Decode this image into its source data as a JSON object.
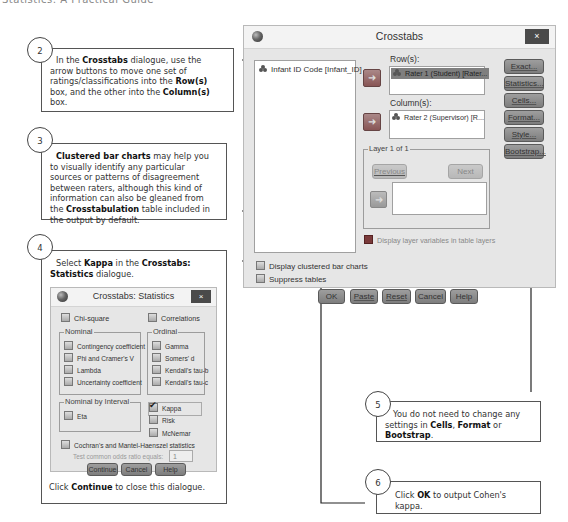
{
  "page_header": "Statistics: A Practical Guide",
  "callouts": [
    {
      "number": "2",
      "parts": [
        {
          "t": "In the ",
          "b": false
        },
        {
          "t": "Crosstabs",
          "b": true
        },
        {
          "t": " dialogue, use the arrow buttons to move one set of ratings/classifications into the ",
          "b": false
        },
        {
          "t": "Row(s)",
          "b": true
        },
        {
          "t": " box, and the other into the ",
          "b": false
        },
        {
          "t": "Column(s)",
          "b": true
        },
        {
          "t": " box.",
          "b": false
        }
      ]
    },
    {
      "number": "3",
      "parts": [
        {
          "t": "Clustered bar charts",
          "b": true
        },
        {
          "t": " may help you to visually identify any particular sources or patterns of disagreement between raters, although this kind of information can also be gleaned from the ",
          "b": false
        },
        {
          "t": "Crosstabulation",
          "b": true
        },
        {
          "t": " table included in the output by default.",
          "b": false
        }
      ]
    },
    {
      "number": "4",
      "parts": [
        {
          "t": "Select ",
          "b": false
        },
        {
          "t": "Kappa",
          "b": true
        },
        {
          "t": " in the ",
          "b": false
        },
        {
          "t": "Crosstabs: Statistics",
          "b": true
        },
        {
          "t": " dialogue.",
          "b": false
        }
      ],
      "footer_parts": [
        {
          "t": "Click ",
          "b": false
        },
        {
          "t": "Continue",
          "b": true
        },
        {
          "t": " to close this dialogue.",
          "b": false
        }
      ]
    },
    {
      "number": "5",
      "parts": [
        {
          "t": "You do not need to change any settings in ",
          "b": false
        },
        {
          "t": "Cells",
          "b": true
        },
        {
          "t": ", ",
          "b": false
        },
        {
          "t": "Format",
          "b": true
        },
        {
          "t": " or ",
          "b": false
        },
        {
          "t": "Bootstrap",
          "b": true
        },
        {
          "t": ".",
          "b": false
        }
      ]
    },
    {
      "number": "6",
      "parts": [
        {
          "t": "Click ",
          "b": false
        },
        {
          "t": "OK",
          "b": true
        },
        {
          "t": " to output Cohen's kappa.",
          "b": false
        }
      ]
    }
  ],
  "crosstabs": {
    "title": "Crosstabs",
    "close": "×",
    "source_vars": [
      "Infant ID Code [Infant_ID]"
    ],
    "rows_label": "Row(s):",
    "rows_vars": [
      "Rater 1 (Student) [Rater..."
    ],
    "columns_label": "Column(s):",
    "columns_vars": [
      "Rater 2 (Supervisor) [R..."
    ],
    "side_buttons": [
      "Exact...",
      "Statistics...",
      "Cells...",
      "Format...",
      "Style...",
      "Bootstrap..."
    ],
    "layer_label": "Layer 1 of 1",
    "previous": "Previous",
    "next": "Next",
    "display_layer": "Display layer variables in table layers",
    "display_clustered": "Display clustered bar charts",
    "suppress_tables": "Suppress tables",
    "bottom_buttons": [
      "OK",
      "Paste",
      "Reset",
      "Cancel",
      "Help"
    ]
  },
  "stats_dialog": {
    "title": "Crosstabs: Statistics",
    "close": "×",
    "chi_square": "Chi-square",
    "correlations": "Correlations",
    "nominal_label": "Nominal",
    "nominal": [
      "Contingency coefficient",
      "Phi and Cramer's V",
      "Lambda",
      "Uncertainty coefficient"
    ],
    "ordinal_label": "Ordinal",
    "ordinal": [
      "Gamma",
      "Somers' d",
      "Kendall's tau-b",
      "Kendall's tau-c"
    ],
    "nbi_label": "Nominal by Interval",
    "eta": "Eta",
    "kappa": "Kappa",
    "kappa_checked": true,
    "risk": "Risk",
    "mcnemar": "McNemar",
    "cochran": "Cochran's and Mantel-Haenszel statistics",
    "test_odds_label": "Test common odds ratio equals:",
    "test_odds_value": "1",
    "buttons": [
      "Continue",
      "Cancel",
      "Help"
    ]
  }
}
